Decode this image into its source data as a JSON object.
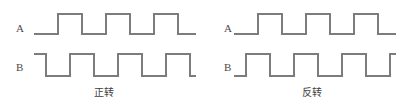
{
  "figure": {
    "type": "quadrature-encoder-waveform-diagram",
    "background_color": "#ffffff",
    "line_color": "#7c7c7c",
    "text_color": "#3d3d3d"
  },
  "panels": [
    {
      "id": "forward",
      "caption": "正转",
      "channels": [
        {
          "id": "A",
          "label": "A",
          "start_level": "low",
          "path": "M 34 34 L 58 34 L 58 14 L 82 14 L 82 34 L 106 34 L 106 14 L 130 14 L 130 34 L 154 34 L 154 14 L 178 14 L 178 34 L 196 34"
        },
        {
          "id": "B",
          "label": "B",
          "start_level": "high",
          "path": "M 34 54 L 46 54 L 46 76 L 70 76 L 70 54 L 94 54 L 94 76 L 118 76 L 118 54 L 142 54 L 142 76 L 166 76 L 166 54 L 190 54 L 190 76 L 196 76"
        }
      ]
    },
    {
      "id": "reverse",
      "caption": "反转",
      "channels": [
        {
          "id": "A",
          "label": "A",
          "start_level": "low",
          "path": "M 26 34 L 50 34 L 50 14 L 74 14 L 74 34 L 98 34 L 98 14 L 122 14 L 122 34 L 146 34 L 146 14 L 170 14 L 170 34 L 188 34"
        },
        {
          "id": "B",
          "label": "B",
          "start_level": "low",
          "path": "M 26 76 L 38 76 L 38 54 L 62 54 L 62 76 L 86 76 L 86 54 L 110 54 L 110 76 L 134 76 L 134 54 L 158 54 L 158 76 L 182 76 L 182 54 L 188 54"
        }
      ]
    }
  ]
}
